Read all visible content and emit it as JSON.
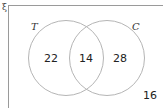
{
  "universal_symbol": "ξ",
  "sets": [
    {
      "name": "T",
      "label": "T"
    },
    {
      "name": "C",
      "label": "C"
    }
  ],
  "regions": {
    "only_T": "22",
    "both": "14",
    "only_C": "28",
    "neither": "16"
  },
  "colors": {
    "circle_stroke": "#b5b5b5",
    "frame_stroke": "#9a9a9a",
    "text": "#222222"
  }
}
